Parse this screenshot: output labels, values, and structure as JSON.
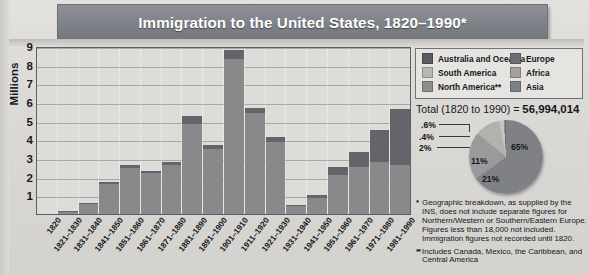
{
  "title": "Immigration to the United States, 1820–1990*",
  "axis": {
    "ylabel": "Millions",
    "yticks": [
      "9",
      "8",
      "7",
      "6",
      "5",
      "4",
      "3",
      "2",
      "1"
    ]
  },
  "legend": {
    "items": [
      {
        "label": "Australia and Oceania",
        "color": "#5a5c62"
      },
      {
        "label": "Europe",
        "color": "#6e7076"
      },
      {
        "label": "South America",
        "color": "#b9b7b3"
      },
      {
        "label": "Africa",
        "color": "#a4a2a0"
      },
      {
        "label": "North America**",
        "color": "#908e8c"
      },
      {
        "label": "Asia",
        "color": "#7e8086"
      }
    ]
  },
  "total": {
    "prefix": "Total (1820 to 1990) = ",
    "value": "56,994,014"
  },
  "notes": {
    "note1_marker": "*",
    "note1": "Geographic breakdown, as supplied by the INS, does not include separate figures for Northern/Western or Southern/Eastern Europe. Figures less than 18,000 not included. Immigration figures not recorded until 1820.",
    "note2_marker": "**",
    "note2": "Includes Canada, Mexico, the Caribbean, and Central America"
  },
  "chart_data": {
    "type": "bar",
    "title": "Immigration to the United States, 1820–1990*",
    "xlabel": "",
    "ylabel": "Millions",
    "ylim": [
      0,
      9
    ],
    "grid": true,
    "legend_position": "top-right",
    "categories": [
      "1820",
      "1821–1830",
      "1831–1840",
      "1841–1850",
      "1851–1860",
      "1861–1870",
      "1871–1880",
      "1881–1890",
      "1891–1900",
      "1901–1910",
      "1911–1920",
      "1921–1930",
      "1931–1940",
      "1941–1950",
      "1951–1960",
      "1961–1970",
      "1971–1980",
      "1981–1990"
    ],
    "values": [
      0.01,
      0.15,
      0.6,
      1.7,
      2.6,
      2.3,
      2.8,
      5.25,
      3.7,
      8.8,
      5.7,
      4.1,
      0.5,
      1.0,
      2.5,
      3.3,
      4.5,
      5.6
    ],
    "stacks": [
      {
        "base": 0.01,
        "top": 0.0
      },
      {
        "base": 0.13,
        "top": 0.02
      },
      {
        "base": 0.55,
        "top": 0.05
      },
      {
        "base": 1.6,
        "top": 0.1
      },
      {
        "base": 2.45,
        "top": 0.15
      },
      {
        "base": 2.2,
        "top": 0.1
      },
      {
        "base": 2.6,
        "top": 0.2
      },
      {
        "base": 4.8,
        "top": 0.45
      },
      {
        "base": 3.5,
        "top": 0.2
      },
      {
        "base": 8.3,
        "top": 0.5
      },
      {
        "base": 5.4,
        "top": 0.3
      },
      {
        "base": 3.85,
        "top": 0.25
      },
      {
        "base": 0.45,
        "top": 0.05
      },
      {
        "base": 0.85,
        "top": 0.15
      },
      {
        "base": 2.1,
        "top": 0.4
      },
      {
        "base": 2.5,
        "top": 0.8
      },
      {
        "base": 2.8,
        "top": 1.7
      },
      {
        "base": 2.6,
        "top": 3.0
      }
    ],
    "base_color": "#8a888a",
    "top_color": "#63656b"
  },
  "pie_data": {
    "type": "pie",
    "title": "Total (1820 to 1990) = 56,994,014",
    "labels": [
      "65%",
      "21%",
      "11%",
      "2%",
      ".4%",
      ".6%"
    ],
    "values": [
      65,
      21,
      11,
      2,
      0.4,
      0.6
    ],
    "colors": [
      "#7f8187",
      "#9b999a",
      "#b3b1ae",
      "#c6c4c0",
      "#8d8b8b",
      "#6a6c72"
    ]
  }
}
